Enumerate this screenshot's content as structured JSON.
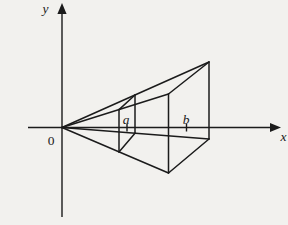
{
  "figure": {
    "background_color": "#f2f1ee",
    "ink_color": "#1b1b1b",
    "labels": {
      "y_axis": "y",
      "x_axis": "x",
      "origin": "0",
      "point_a": "a",
      "point_b": "b"
    },
    "geometry": {
      "canvas": {
        "width": 288,
        "height": 225
      },
      "axes": [
        {
          "name": "x-axis",
          "line": [
            28,
            127.5,
            272.5,
            127.5
          ],
          "arrow_tip": [
            281,
            127.5
          ],
          "arrow_dir": "right",
          "arrow_length": 11,
          "arrow_halfwidth": 4.6
        },
        {
          "name": "y-axis",
          "line": [
            62,
            217,
            62,
            11.5
          ],
          "arrow_tip": [
            62,
            3
          ],
          "arrow_dir": "up",
          "arrow_length": 11,
          "arrow_halfwidth": 4.6
        }
      ],
      "segments": [
        {
          "name": "edge-apex-to-base-top-back",
          "kind": "solid-line",
          "pts": [
            62,
            127.5,
            209,
            62
          ]
        },
        {
          "name": "edge-apex-to-base-top-front",
          "kind": "solid-line",
          "pts": [
            62,
            127.5,
            168.5,
            94
          ]
        },
        {
          "name": "edge-apex-to-base-bottom-front",
          "kind": "solid-line",
          "pts": [
            62,
            127.5,
            168.5,
            173
          ]
        },
        {
          "name": "edge-apex-to-base-bottom-back",
          "kind": "solid-line",
          "pts": [
            62,
            127.5,
            209,
            139
          ]
        },
        {
          "name": "base-top-edge",
          "kind": "solid-line",
          "pts": [
            168.5,
            94,
            209,
            62
          ]
        },
        {
          "name": "base-back-edge",
          "kind": "solid-line",
          "pts": [
            209,
            62,
            209,
            139
          ]
        },
        {
          "name": "base-bottom-edge",
          "kind": "solid-line",
          "pts": [
            209,
            139,
            168.5,
            173
          ]
        },
        {
          "name": "base-front-edge",
          "kind": "solid-line",
          "pts": [
            168.5,
            173,
            168.5,
            94
          ]
        },
        {
          "name": "section-a-top-edge",
          "kind": "solid-line",
          "pts": [
            119,
            109.6,
            135,
            95
          ]
        },
        {
          "name": "section-a-back-edge",
          "kind": "solid-line",
          "pts": [
            135,
            95,
            135,
            133.2
          ]
        },
        {
          "name": "section-a-bottom-edge",
          "kind": "solid-line",
          "pts": [
            135,
            133.2,
            119,
            151.9
          ]
        },
        {
          "name": "section-a-front-edge",
          "kind": "solid-line",
          "pts": [
            119,
            151.9,
            119,
            109.6
          ]
        },
        {
          "name": "tick-a",
          "kind": "tick-line",
          "pts": [
            127,
            124,
            127,
            131.5
          ]
        },
        {
          "name": "tick-b",
          "kind": "tick-line",
          "pts": [
            186.5,
            124,
            186.5,
            131.5
          ]
        }
      ]
    }
  }
}
